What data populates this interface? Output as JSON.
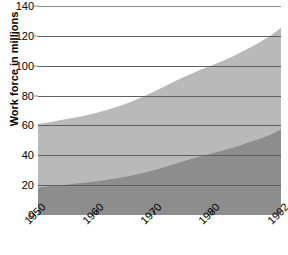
{
  "chart_data": {
    "type": "area",
    "title": "",
    "subtitle": "",
    "xlabel": "",
    "ylabel": "Work force in millions",
    "stacked": true,
    "grid": true,
    "legend": "none",
    "xlim": [
      1950,
      1992
    ],
    "ylim": [
      0,
      140
    ],
    "x_ticks": [
      1950,
      1960,
      1970,
      1980,
      1992
    ],
    "x_tick_labels": [
      "1950",
      "1960",
      "1970",
      "1980",
      "1992"
    ],
    "y_ticks": [
      0,
      20,
      40,
      60,
      80,
      100,
      120,
      140
    ],
    "y_tick_labels": [
      "0",
      "20",
      "40",
      "60",
      "80",
      "100",
      "120",
      "140"
    ],
    "x": [
      1950,
      1952,
      1954,
      1956,
      1958,
      1960,
      1962,
      1964,
      1966,
      1968,
      1970,
      1972,
      1974,
      1976,
      1978,
      1980,
      1982,
      1984,
      1986,
      1988,
      1990,
      1992
    ],
    "series": [
      {
        "name": "lower-band",
        "color": "#8d8d8d",
        "values": [
          18.5,
          19.2,
          20.0,
          20.8,
          21.6,
          22.5,
          23.6,
          24.8,
          26.3,
          28.0,
          30.0,
          32.2,
          34.6,
          37.0,
          39.2,
          41.2,
          43.2,
          45.4,
          48.0,
          50.6,
          53.4,
          57.5
        ]
      },
      {
        "name": "upper-band",
        "color": "#b9b9b9",
        "values": [
          42.5,
          43.0,
          43.6,
          44.2,
          44.9,
          45.8,
          46.9,
          48.1,
          49.4,
          51.0,
          52.6,
          54.2,
          55.6,
          56.8,
          58.0,
          59.0,
          60.2,
          61.4,
          62.8,
          64.4,
          66.2,
          68.0
        ]
      }
    ],
    "totals": [
      61.0,
      62.2,
      63.6,
      65.0,
      66.5,
      68.3,
      70.5,
      72.9,
      75.7,
      79.0,
      82.6,
      86.4,
      90.2,
      93.8,
      97.2,
      100.2,
      103.4,
      106.8,
      110.8,
      115.0,
      119.6,
      125.5
    ],
    "colors": {
      "lower_band": "#8d8d8d",
      "upper_band": "#b9b9b9",
      "gridline": "#8c8c8c",
      "gridline_over_fill": "#5f5f5f",
      "background": "#ffffff",
      "text": "#000000"
    }
  }
}
